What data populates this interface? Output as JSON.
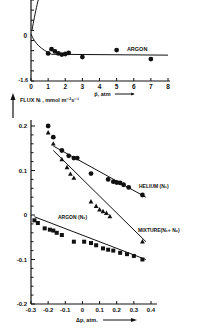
{
  "chart_data": [
    {
      "type": "scatter",
      "title": "",
      "xlabel": "p̄, atm",
      "ylabel": "",
      "xlim": [
        0,
        8
      ],
      "ylim": [
        -1.6,
        0.6
      ],
      "x_ticks": [
        "0",
        "1",
        "2",
        "3",
        "4",
        "5",
        "6",
        "7",
        "8"
      ],
      "y_ticks": [
        "0",
        "-1.6"
      ],
      "grid": false,
      "series": [
        {
          "name": "ARGON",
          "marker": "circle",
          "x": [
            1.0,
            1.2,
            1.4,
            1.6,
            1.8,
            2.0,
            2.2,
            3.0,
            5.0,
            7.0
          ],
          "y": [
            -0.62,
            -0.47,
            -0.55,
            -0.62,
            -0.66,
            -0.64,
            -0.6,
            -0.75,
            -0.5,
            -0.82
          ]
        }
      ],
      "annotations": [
        "ARGON"
      ]
    },
    {
      "type": "scatter",
      "title": "",
      "xlabel": "Δp, atm.",
      "ylabel": "FLUX  Ni , mmol m⁻²s⁻¹",
      "xlim": [
        -0.3,
        0.4
      ],
      "ylim": [
        -0.2,
        0.2
      ],
      "x_ticks": [
        "-0.3",
        "-0.2",
        "-0.1",
        "0",
        "0.1",
        "0.2",
        "0.3",
        "0.4"
      ],
      "y_ticks": [
        "0.2",
        "0.1",
        "0",
        "-0.1",
        "-0.2"
      ],
      "grid": false,
      "series": [
        {
          "name": "HELIUM (N1)",
          "marker": "circle",
          "x": [
            -0.2,
            -0.17,
            -0.12,
            -0.08,
            -0.05,
            -0.03,
            0.05,
            0.15,
            0.18,
            0.2,
            0.22,
            0.24,
            0.27,
            0.35
          ],
          "y": [
            0.2,
            0.175,
            0.145,
            0.133,
            0.128,
            0.128,
            0.093,
            0.08,
            0.075,
            0.073,
            0.072,
            0.068,
            0.062,
            0.045
          ],
          "fit": {
            "x": [
              -0.17,
              0.37
            ],
            "y": [
              0.155,
              0.04
            ]
          }
        },
        {
          "name": "MIXTURE (N1+N2)",
          "marker": "triangle",
          "x": [
            -0.2,
            -0.17,
            -0.12,
            -0.09,
            -0.07,
            -0.05,
            0.05,
            0.08,
            0.1,
            0.12,
            0.14,
            0.16,
            0.35
          ],
          "y": [
            0.185,
            0.16,
            0.125,
            0.107,
            0.092,
            0.083,
            0.03,
            0.02,
            0.012,
            0.008,
            0.004,
            -0.003,
            -0.06
          ],
          "fit": {
            "x": [
              -0.17,
              0.37
            ],
            "y": [
              0.145,
              -0.06
            ]
          }
        },
        {
          "name": "ARGON (N2)",
          "marker": "square",
          "x": [
            -0.28,
            -0.26,
            -0.22,
            -0.19,
            -0.17,
            -0.15,
            -0.12,
            -0.05,
            0.01,
            0.05,
            0.08,
            0.12,
            0.15,
            0.18,
            0.22,
            0.26,
            0.3,
            0.35
          ],
          "y": [
            -0.012,
            -0.018,
            -0.03,
            -0.033,
            -0.035,
            -0.04,
            -0.045,
            -0.06,
            -0.06,
            -0.063,
            -0.068,
            -0.075,
            -0.078,
            -0.08,
            -0.085,
            -0.088,
            -0.092,
            -0.1
          ],
          "fit": {
            "x": [
              -0.28,
              0.37
            ],
            "y": [
              -0.004,
              -0.1
            ]
          }
        }
      ],
      "annotations": [
        "HELIUM (N1)",
        "MIXTURE (N1+N2)",
        "ARGON (N2)"
      ]
    }
  ],
  "labels": {
    "top_series": "ARGON",
    "top_xlabel": "p̄, atm",
    "top_y0": "0",
    "top_ymin": "-1.6",
    "bottom_ylabel": "FLUX  Nᵢ , mmol m⁻²s⁻¹",
    "helium": "HELIUM (N₁)",
    "mixture": "MIXTURE(N₁+ N₂)",
    "argon_n2": "ARGON (N₂)",
    "bottom_xlabel": "Δp, atm."
  }
}
